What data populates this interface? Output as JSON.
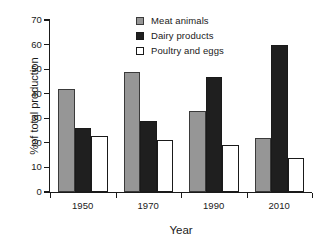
{
  "chart_data": {
    "type": "bar",
    "title": "",
    "subtitle": "",
    "xlabel": "Year",
    "ylabel": "%of total production",
    "categories": [
      "1950",
      "1970",
      "1990",
      "2010"
    ],
    "series": [
      {
        "name": "Meat animals",
        "color": "#969696",
        "values": [
          42,
          49,
          33,
          22
        ]
      },
      {
        "name": "Dairy products",
        "color": "#1f1f1f",
        "values": [
          26,
          29,
          47,
          60
        ]
      },
      {
        "name": "Poultry and eggs",
        "color": "#ffffff",
        "values": [
          23,
          21,
          19,
          14
        ]
      }
    ],
    "ylim": [
      0,
      70
    ],
    "ytick_labels": [
      "0",
      "10",
      "20",
      "30",
      "40",
      "50",
      "60",
      "70"
    ],
    "ytick_values": [
      0,
      10,
      20,
      30,
      40,
      50,
      60,
      70
    ],
    "grid": false,
    "legend_position": "top-center",
    "axis_color": "#1a1a1a",
    "background": "#ffffff"
  },
  "legend": {
    "entries": [
      {
        "label": "Meat animals"
      },
      {
        "label": "Dairy products"
      },
      {
        "label": "Poultry and eggs"
      }
    ]
  }
}
